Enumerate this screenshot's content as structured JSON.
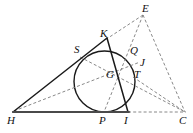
{
  "figure": {
    "width": 193,
    "height": 133,
    "background_color": "#ffffff",
    "stroke_color": "#1a1a1a",
    "dashed_color": "#6f6f6f",
    "baseline_color": "#4a4a4a"
  },
  "points": [
    {
      "id": "H",
      "label": "H",
      "x": 13,
      "y": 112,
      "label_x": 7,
      "label_y": 115
    },
    {
      "id": "P",
      "label": "P",
      "x": 104,
      "y": 112,
      "label_x": 99,
      "label_y": 115
    },
    {
      "id": "I",
      "label": "I",
      "x": 128,
      "y": 112,
      "label_x": 124,
      "label_y": 115
    },
    {
      "id": "C",
      "label": "C",
      "x": 185,
      "y": 112,
      "label_x": 179,
      "label_y": 115
    },
    {
      "id": "S",
      "label": "S",
      "x": 84,
      "y": 54,
      "label_x": 74,
      "label_y": 44
    },
    {
      "id": "K",
      "label": "K",
      "x": 106,
      "y": 40,
      "label_x": 100,
      "label_y": 28
    },
    {
      "id": "Q",
      "label": "Q",
      "x": 130,
      "y": 55,
      "label_x": 130,
      "label_y": 45
    },
    {
      "id": "E",
      "label": "E",
      "x": 143,
      "y": 14,
      "label_x": 142,
      "label_y": 3
    },
    {
      "id": "J",
      "label": "J",
      "x": 138,
      "y": 64,
      "label_x": 140,
      "label_y": 57
    },
    {
      "id": "T",
      "label": "T",
      "x": 133,
      "y": 77,
      "label_x": 134,
      "label_y": 69
    },
    {
      "id": "G",
      "label": "G",
      "x": 110,
      "y": 78,
      "label_x": 106,
      "label_y": 69
    }
  ],
  "circle": {
    "name": "incircle",
    "cx": 104.5,
    "cy": 81.5,
    "r": 30.5
  },
  "solid_segments": [
    {
      "name": "side-H-K",
      "from": "H",
      "to": "K"
    },
    {
      "name": "side-K-I",
      "from": "K",
      "to": "I"
    },
    {
      "name": "baseline-H-I",
      "from": "H",
      "to": "I"
    }
  ],
  "dashed_segments": [
    {
      "name": "baseline-I-C",
      "from": "I",
      "to": "C"
    },
    {
      "name": "cevian-E-K",
      "from": "E",
      "to": "K"
    },
    {
      "name": "cevian-E-P",
      "from": "E",
      "to": "P"
    },
    {
      "name": "cevian-E-C",
      "from": "E",
      "to": "C"
    },
    {
      "name": "chord-S-C",
      "from": "S",
      "to": "C"
    },
    {
      "name": "chord-H-J",
      "from": "H",
      "to": "J"
    },
    {
      "name": "segment-T-C",
      "from": "T",
      "to": "C"
    }
  ],
  "labels_note": "All point labels are italic serif, as in the original figure."
}
